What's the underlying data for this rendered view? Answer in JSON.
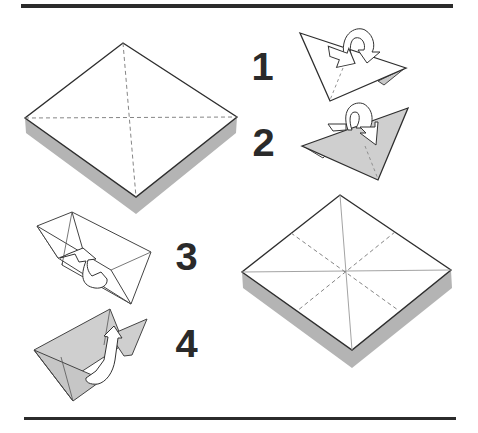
{
  "diagram": {
    "type": "origami-folding-instructions",
    "colors": {
      "rule": "#2b2b2b",
      "outline": "#333333",
      "shadow": "#b4b4b4",
      "paper_front": "#ffffff",
      "paper_back": "#cfcfcf",
      "crease": "#888888",
      "step_number": "#2a2a2a"
    },
    "steps": [
      {
        "number": "1",
        "description": "Fold triangle, flap folded back (arrow loops behind)"
      },
      {
        "number": "2",
        "description": "Shaded triangle, flap folded (arrow loops over)"
      },
      {
        "number": "3",
        "description": "Open box-like form, arrow lifts inner flap up"
      },
      {
        "number": "4",
        "description": "Shaded box-like form, arrow lifts inner flap up"
      }
    ],
    "figures": [
      {
        "name": "square-with-diagonal-creases",
        "crease_style": "dashed diagonals"
      },
      {
        "name": "square-with-eight-creases",
        "crease_style": "solid diagonals, dashed medians"
      }
    ]
  }
}
